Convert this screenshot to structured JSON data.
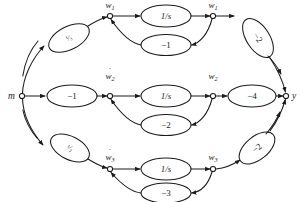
{
  "diagram": {
    "type": "signal-flow-graph",
    "title": "",
    "terminals": {
      "input": "m",
      "output": "y"
    },
    "nodes": [
      {
        "id": "n-wdot1",
        "label": "w",
        "subscript": "1",
        "dot": true,
        "display": "ẇ₁"
      },
      {
        "id": "n-w1",
        "label": "w",
        "subscript": "1",
        "dot": false,
        "display": "w₁"
      },
      {
        "id": "n-wdot2",
        "label": "w",
        "subscript": "2",
        "dot": true,
        "display": "ẇ₂"
      },
      {
        "id": "n-w2",
        "label": "w",
        "subscript": "2",
        "dot": false,
        "display": "w₂"
      },
      {
        "id": "n-wdot3",
        "label": "w",
        "subscript": "3",
        "dot": true,
        "display": "ẇ₃"
      },
      {
        "id": "n-w3",
        "label": "w",
        "subscript": "3",
        "dot": false,
        "display": "w₃"
      }
    ],
    "branches": [
      {
        "row": "top",
        "input_gain": {
          "numerator": "1",
          "denominator": "3",
          "display": "¹⁄₃"
        },
        "integrator": "1/s",
        "feedback_gain": "−1",
        "output_gain": "−2"
      },
      {
        "row": "middle",
        "input_gain": {
          "numerator": "",
          "denominator": "",
          "display": "−1"
        },
        "integrator": "1/s",
        "feedback_gain": "−2",
        "output_gain": "−4"
      },
      {
        "row": "bottom",
        "input_gain": {
          "numerator": "1",
          "denominator": "2",
          "display": "¹⁄₂"
        },
        "integrator": "1/s",
        "feedback_gain": "−3",
        "output_gain": "−2"
      }
    ],
    "labels": {
      "input_gain_top": "¹⁄₃",
      "input_gain_mid": "−1",
      "input_gain_bot": "¹⁄₂",
      "integrator_top": "1/s",
      "integrator_mid": "1/s",
      "integrator_bot": "1/s",
      "feedback_top": "−1",
      "feedback_mid": "−2",
      "feedback_bot": "−3",
      "output_top": "−2",
      "output_mid": "−4",
      "output_bot": "−2",
      "node_wdot1": "w",
      "node_wdot1_sub": "1",
      "node_w1": "w",
      "node_w1_sub": "1",
      "node_wdot2": "w",
      "node_wdot2_sub": "2",
      "node_w2": "w",
      "node_w2_sub": "2",
      "node_wdot3": "w",
      "node_wdot3_sub": "3",
      "node_w3": "w",
      "node_w3_sub": "3",
      "terminal_in": "m",
      "terminal_out": "y",
      "dot_glyph": "˙"
    },
    "colors": {
      "stroke": "#1b1b1b",
      "background": "#ffffff"
    }
  }
}
